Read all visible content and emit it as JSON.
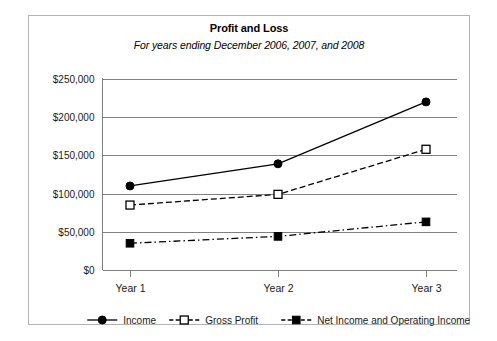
{
  "chart_data": {
    "type": "line",
    "title": "Profit and Loss",
    "subtitle": "For years  ending December 2006, 2007, and 2008",
    "xlabel": "",
    "ylabel": "",
    "categories": [
      "Year 1",
      "Year 2",
      "Year 3"
    ],
    "ylim": [
      0,
      250000
    ],
    "ytick_labels": [
      "$0",
      "$50,000",
      "$100,000",
      "$150,000",
      "$200,000",
      "$250,000"
    ],
    "ytick_values": [
      0,
      50000,
      100000,
      150000,
      200000,
      250000
    ],
    "grid": "horizontal",
    "legend_position": "bottom",
    "series": [
      {
        "name": "Income",
        "values": [
          110000,
          139000,
          220000
        ],
        "marker": "filled-circle",
        "linestyle": "solid",
        "color": "#000000"
      },
      {
        "name": "Gross Profit",
        "values": [
          85000,
          99000,
          158000
        ],
        "marker": "open-square",
        "linestyle": "dashed",
        "color": "#000000"
      },
      {
        "name": "Net Income and Operating Income",
        "values": [
          35000,
          44000,
          63000
        ],
        "marker": "filled-square",
        "linestyle": "dash-dot",
        "color": "#000000"
      }
    ]
  },
  "card": {
    "border_color": "#b3b3b3",
    "background": "#ffffff"
  },
  "axis": {
    "line_color": "#808080",
    "grid_color": "#808080"
  }
}
